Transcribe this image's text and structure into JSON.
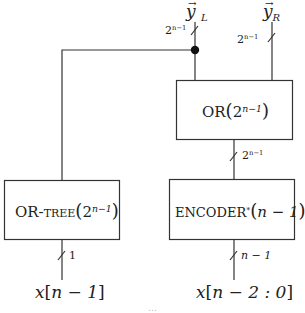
{
  "diagram": {
    "type": "block-diagram",
    "blocks": [
      {
        "id": "or",
        "name": "OR",
        "arg_base": "2",
        "arg_exp": "n−1",
        "label_text": "OR(2^{n−1})"
      },
      {
        "id": "or_tree",
        "name": "OR-tree",
        "arg_base": "2",
        "arg_exp": "n−1",
        "label_text": "OR-tree(2^{n−1})"
      },
      {
        "id": "encoder",
        "name": "ENCODER",
        "star": "*",
        "arg": "n − 1",
        "label_text": "ENCODER*(n−1)"
      }
    ],
    "outputs": {
      "y_left": {
        "base": "y",
        "sub": "L",
        "bus_base": "2",
        "bus_exp": "n−1"
      },
      "y_right": {
        "base": "y",
        "sub": "R",
        "bus_base": "2",
        "bus_exp": "n−1"
      }
    },
    "buses": {
      "or_to_encoder": {
        "base": "2",
        "exp": "n−1"
      },
      "or_tree_input": "1",
      "encoder_input": "n − 1"
    },
    "inputs": {
      "left": {
        "var": "x",
        "index": "n − 1"
      },
      "right": {
        "var": "x",
        "index": "n − 2 : 0"
      }
    },
    "edges": [
      "x[n−1] → OR-tree(2^{n−1})",
      "OR-tree(2^{n−1}) → junction → y_L",
      "OR(2^{n−1}) → junction → y_L",
      "OR(2^{n−1}) → y_R",
      "ENCODER*(n−1) → OR(2^{n−1})",
      "x[n−2:0] → ENCODER*(n−1)"
    ],
    "caption_partial": "…"
  }
}
